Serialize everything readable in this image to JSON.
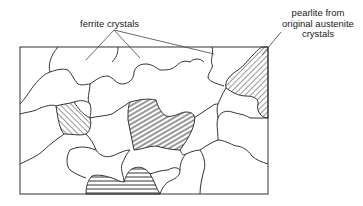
{
  "diagram": {
    "type": "microstructure-schematic",
    "labels": {
      "ferrite": "ferrite crystals",
      "pearlite_line1": "pearlite from",
      "pearlite_line2": "original austenite",
      "pearlite_line3": "crystals"
    },
    "colors": {
      "line": "#333333",
      "background": "#ffffff",
      "hatch": "#333333"
    },
    "regions": {
      "ferrite_count": 12,
      "pearlite_count": 5,
      "pearlite_hatch_styles": [
        "diagonal",
        "horizontal"
      ]
    }
  }
}
